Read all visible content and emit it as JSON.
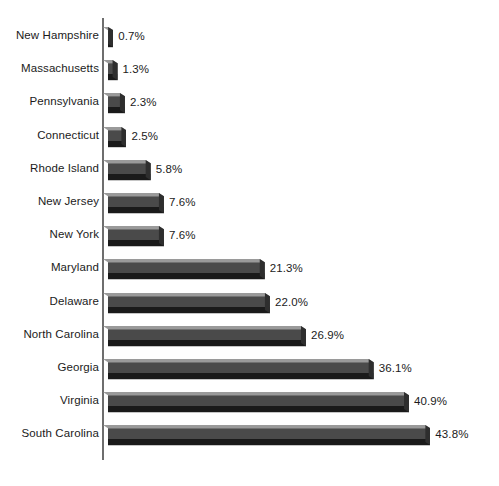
{
  "chart_data": {
    "type": "bar",
    "orientation": "horizontal",
    "title": "",
    "subtitle": "",
    "xlabel": "",
    "ylabel": "",
    "xlim": [
      0,
      43.8
    ],
    "grid": false,
    "legend": null,
    "value_suffix": "%",
    "categories": [
      "New Hampshire",
      "Massachusetts",
      "Pennsylvania",
      "Connecticut",
      "Rhode Island",
      "New Jersey",
      "New York",
      "Maryland",
      "Delaware",
      "North Carolina",
      "Georgia",
      "Virginia",
      "South Carolina"
    ],
    "values": [
      0.7,
      1.3,
      2.3,
      2.5,
      5.8,
      7.6,
      7.6,
      21.3,
      22.0,
      26.9,
      36.1,
      40.9,
      43.8
    ],
    "value_labels": [
      "0.7%",
      "1.3%",
      "2.3%",
      "2.5%",
      "5.8%",
      "7.6%",
      "7.6%",
      "21.3%",
      "22.0%",
      "26.9%",
      "36.1%",
      "40.9%",
      "43.8%"
    ],
    "colors": {
      "bar_top": "#9a9a9a",
      "bar_face": "#4a4a4a",
      "bar_shadow": "#1a1a1a",
      "bar_cap": "#2e2e2e",
      "axis": "#6e6e6e",
      "text": "#1b1b1b",
      "background": "#ffffff"
    }
  }
}
